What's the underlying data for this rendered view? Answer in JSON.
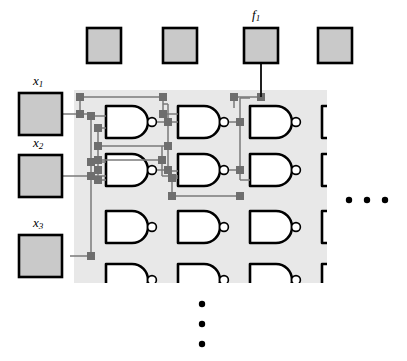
{
  "figure": {
    "background_color": "#ffffff",
    "panel_color": "#e8e8e8",
    "pad_fill_color": "#c9c9c9",
    "pad_stroke_color": "#000000",
    "gate_stroke_color": "#000000",
    "wire_color": "#7a7a7a",
    "node_color": "#6e6e6e",
    "dot_color": "#000000"
  },
  "labels": {
    "output_pad": {
      "base": "f",
      "sub": "1",
      "text": "f1"
    },
    "input_pad_1": {
      "base": "x",
      "sub": "1",
      "text": "x1"
    },
    "input_pad_2": {
      "base": "x",
      "sub": "2",
      "text": "x2"
    },
    "input_pad_3": {
      "base": "x",
      "sub": "3",
      "text": "x3"
    }
  },
  "output_pads": [
    {
      "name": "output-pad-1",
      "label": ""
    },
    {
      "name": "output-pad-2",
      "label": ""
    },
    {
      "name": "output-pad-3",
      "label": "f1"
    },
    {
      "name": "output-pad-4",
      "label": ""
    }
  ],
  "input_pads": [
    {
      "name": "input-pad-x1",
      "label": "x1"
    },
    {
      "name": "input-pad-x2",
      "label": "x2"
    },
    {
      "name": "input-pad-x3",
      "label": "x3"
    }
  ],
  "gate_array": {
    "type": "NAND",
    "rows": 4,
    "columns": 4,
    "visible_row_4_clipped": true,
    "total_visible_gates": 16
  },
  "continuation": {
    "horizontal_ellipsis": "· · ·",
    "vertical_ellipsis": "⋮",
    "horizontal_dots_count": 3,
    "vertical_dots_count": 3
  }
}
